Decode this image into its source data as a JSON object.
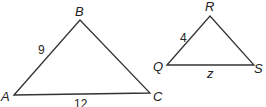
{
  "diagram": {
    "triangles": [
      {
        "name": "ABC",
        "vertices": {
          "A": [
            14,
            95
          ],
          "B": [
            80,
            20
          ],
          "C": [
            150,
            93
          ]
        },
        "vertex_labels": {
          "A": "A",
          "B": "B",
          "C": "C"
        },
        "side_labels": {
          "AB": "9",
          "AC": "12"
        }
      },
      {
        "name": "QRS",
        "vertices": {
          "Q": [
            167,
            65
          ],
          "R": [
            210,
            16
          ],
          "S": [
            254,
            65
          ]
        },
        "vertex_labels": {
          "Q": "Q",
          "R": "R",
          "S": "S"
        },
        "side_labels": {
          "QR": "4",
          "QS": "z"
        }
      }
    ],
    "stroke_color": "#333333"
  }
}
